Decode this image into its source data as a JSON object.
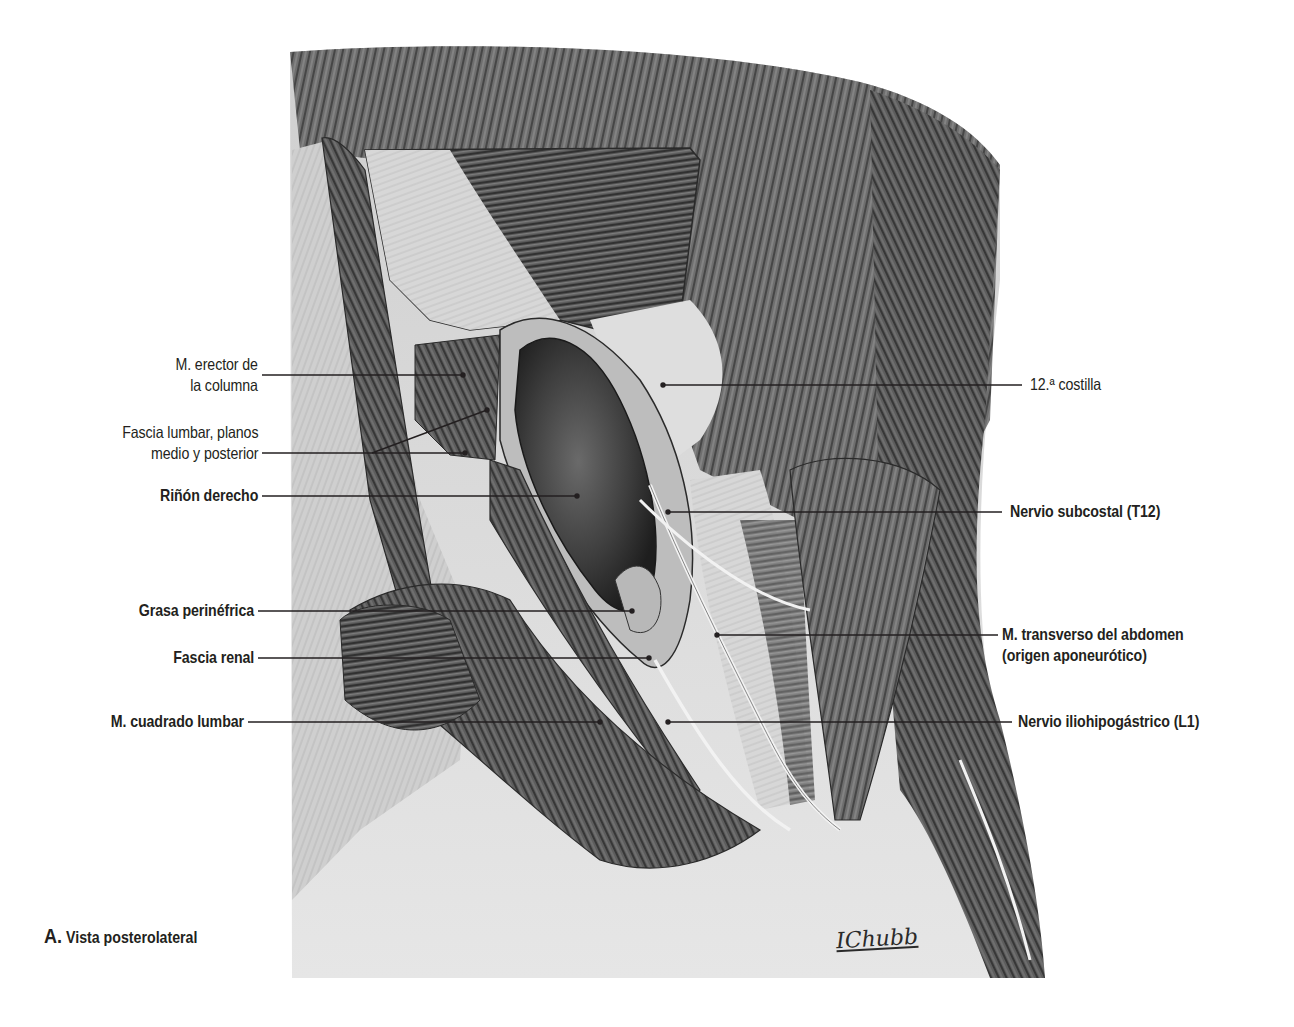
{
  "figure": {
    "caption_letter": "A.",
    "caption_text": "Vista posterolateral",
    "signature": "IChubb",
    "colors": {
      "background": "#ffffff",
      "muscle_dark": "#4a4a4a",
      "muscle_mid": "#7a7a7a",
      "fascia_light": "#d9d9d9",
      "kidney": "#3a3a3a",
      "leader_line": "#231f20",
      "text": "#231f20"
    }
  },
  "labels_left": [
    {
      "id": "erector",
      "line1": "M. erector de",
      "line2": "la columna",
      "bold": false
    },
    {
      "id": "fascia-lumbar",
      "line1": "Fascia lumbar, planos",
      "line2": "medio y posterior",
      "bold": false
    },
    {
      "id": "rinon",
      "line1": "Riñón derecho",
      "bold": true
    },
    {
      "id": "grasa",
      "line1": "Grasa perinéfrica",
      "bold": true
    },
    {
      "id": "fascia-renal",
      "line1": "Fascia renal",
      "bold": true
    },
    {
      "id": "cuadrado",
      "line1": "M. cuadrado lumbar",
      "bold": true
    }
  ],
  "labels_right": [
    {
      "id": "costilla",
      "line1": "12.ª costilla",
      "bold": false
    },
    {
      "id": "subcostal",
      "line1": "Nervio subcostal (T12)",
      "bold": true
    },
    {
      "id": "transverso",
      "line1": "M. transverso del abdomen",
      "line2": "(origen aponeurótico)",
      "bold": true
    },
    {
      "id": "iliohipogastrico",
      "line1": "Nervio iliohipogástrico (L1)",
      "bold": true
    }
  ]
}
